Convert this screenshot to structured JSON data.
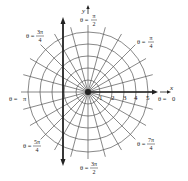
{
  "diagram": {
    "rings": [
      1,
      2,
      3,
      4,
      5
    ],
    "spoke_step_degrees": 15,
    "axis_labels": {
      "x": "x",
      "y": "y"
    },
    "tick_labels": [
      "1",
      "2",
      "3",
      "4",
      "5"
    ],
    "angle_labels": [
      {
        "id": "theta-0",
        "prefix": "θ = ",
        "value": "0",
        "numerator": null,
        "denominator": null
      },
      {
        "id": "theta-pi-4",
        "prefix": "θ = ",
        "numerator": "π",
        "denominator": "4"
      },
      {
        "id": "theta-pi-2",
        "prefix": "θ = ",
        "numerator": "π",
        "denominator": "2"
      },
      {
        "id": "theta-3pi-4",
        "prefix": "θ = ",
        "numerator": "3π",
        "denominator": "4"
      },
      {
        "id": "theta-pi",
        "prefix": "θ = ",
        "value": "π",
        "numerator": null,
        "denominator": null
      },
      {
        "id": "theta-5pi-4",
        "prefix": "θ = ",
        "numerator": "5π",
        "denominator": "4"
      },
      {
        "id": "theta-3pi-2",
        "prefix": "θ = ",
        "numerator": "3π",
        "denominator": "2"
      },
      {
        "id": "theta-7pi-4",
        "prefix": "θ = ",
        "numerator": "7π",
        "denominator": "4"
      }
    ],
    "colors": {
      "grid": "#555555",
      "axis": "#222222",
      "text": "#222222"
    }
  }
}
